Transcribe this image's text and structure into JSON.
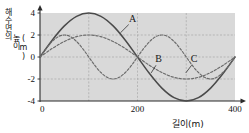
{
  "figure": {
    "title": "",
    "y_axis_label_lines": [
      "해수면의",
      "높이",
      "(m)"
    ],
    "x_axis_label": "길이(m)",
    "background_color": "#d9d9d9",
    "grid_color": "#a8a8a8",
    "axis_color": "#2b2b2b",
    "solid_curve_color": "#4a4a4a",
    "dashed_curve_color": "#6b6b6b"
  },
  "chart_data": {
    "type": "line",
    "title": "",
    "xlabel": "길이(m)",
    "ylabel": "해수면의 높이 (m)",
    "xlim": [
      0,
      400
    ],
    "ylim": [
      -4,
      4
    ],
    "xticks": [
      0,
      200,
      400
    ],
    "xtick_labels": [
      "0",
      "200",
      "400"
    ],
    "yticks": [
      -4,
      -2,
      0,
      2,
      4
    ],
    "ytick_labels": [
      "4",
      "2",
      "0",
      "-2",
      "-4"
    ],
    "grid": true,
    "grid_x": [
      100,
      200,
      300
    ],
    "grid_y": [
      2,
      0,
      -2
    ],
    "legend_position": "inline-annotations",
    "series": [
      {
        "name": "A",
        "label": "A",
        "style": "solid",
        "amplitude": 4,
        "wavelength": 400,
        "phase_deg": 0,
        "label_x": 190,
        "label_y": 3.2,
        "leader_from_x": 182,
        "leader_from_y": 2.95,
        "leader_to_x": 165,
        "leader_to_y": 2.2,
        "x": [
          0,
          25,
          50,
          75,
          100,
          125,
          150,
          175,
          200,
          225,
          250,
          275,
          300,
          325,
          350,
          375,
          400
        ],
        "y": [
          0,
          1.53,
          2.83,
          3.7,
          4.0,
          3.7,
          2.83,
          1.53,
          0,
          -1.53,
          -2.83,
          -3.7,
          -4.0,
          -3.7,
          -2.83,
          -1.53,
          0
        ]
      },
      {
        "name": "B",
        "label": "B",
        "style": "dashed",
        "amplitude": 2,
        "wavelength": 200,
        "phase_deg": 0,
        "label_x": 243,
        "label_y": -0.45,
        "leader_from_x": 238,
        "leader_from_y": -0.75,
        "leader_to_x": 228,
        "leader_to_y": -1.45,
        "x": [
          0,
          12.5,
          25,
          37.5,
          50,
          62.5,
          75,
          87.5,
          100,
          112.5,
          125,
          137.5,
          150,
          162.5,
          175,
          187.5,
          200,
          212.5,
          225,
          237.5,
          250,
          262.5,
          275,
          287.5,
          300,
          312.5,
          325,
          337.5,
          350,
          362.5,
          375,
          387.5,
          400
        ],
        "y": [
          0,
          0.77,
          1.41,
          1.85,
          2.0,
          1.85,
          1.41,
          0.77,
          0,
          -0.77,
          -1.41,
          -1.85,
          -2.0,
          -1.85,
          -1.41,
          -0.77,
          0,
          0.77,
          1.41,
          1.85,
          2.0,
          1.85,
          1.41,
          0.77,
          0,
          -0.77,
          -1.41,
          -1.85,
          -2.0,
          -1.85,
          -1.41,
          -0.77,
          0
        ]
      },
      {
        "name": "C",
        "label": "C",
        "style": "dashed",
        "amplitude": 2,
        "wavelength": 400,
        "phase_deg": 0,
        "label_x": 316,
        "label_y": -0.45,
        "leader_from_x": 311,
        "leader_from_y": -0.75,
        "leader_to_x": 299,
        "leader_to_y": -1.45,
        "x": [
          0,
          25,
          50,
          75,
          100,
          125,
          150,
          175,
          200,
          225,
          250,
          275,
          300,
          325,
          350,
          375,
          400
        ],
        "y": [
          0,
          0.77,
          1.41,
          1.85,
          2.0,
          1.85,
          1.41,
          0.77,
          0,
          -0.77,
          -1.41,
          -1.85,
          -2.0,
          -1.85,
          -1.41,
          -0.77,
          0
        ]
      }
    ]
  }
}
